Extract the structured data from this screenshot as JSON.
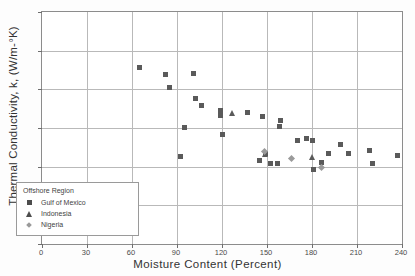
{
  "chart_data": {
    "type": "scatter",
    "title": "",
    "xlabel": "Moisture Content (Percent)",
    "ylabel": "Thermal Conductivity, k, (W/m-°K)",
    "xlim": [
      0,
      240
    ],
    "ylim": [
      0.6,
      1.2
    ],
    "xticks": [
      0,
      30,
      60,
      90,
      120,
      150,
      180,
      210,
      240
    ],
    "yticks": [
      0.6,
      0.7,
      0.8,
      0.9,
      1.0,
      1.1,
      1.2
    ],
    "xtick_labels": [
      "0",
      "30",
      "60",
      "90",
      "120",
      "150",
      "180",
      "210",
      "240"
    ],
    "ytick_labels": [
      "0.6",
      "0.7",
      "0.8",
      "0.9",
      "1.0",
      "1.1",
      "1.2"
    ],
    "grid": true,
    "legend_position": "lower-left",
    "legend_title": "Offshore Region",
    "series": [
      {
        "name": "Gulf of Mexico",
        "marker": "square",
        "color": "#5a5a5a",
        "points": [
          [
            65,
            1.056
          ],
          [
            82,
            1.038
          ],
          [
            85,
            1.004
          ],
          [
            92,
            0.826
          ],
          [
            95,
            0.902
          ],
          [
            101,
            1.042
          ],
          [
            102,
            0.977
          ],
          [
            106,
            0.957
          ],
          [
            119,
            0.945
          ],
          [
            119,
            0.932
          ],
          [
            120,
            0.884
          ],
          [
            137,
            0.939
          ],
          [
            147,
            0.93
          ],
          [
            145,
            0.815
          ],
          [
            149,
            0.834
          ],
          [
            152,
            0.808
          ],
          [
            157,
            0.807
          ],
          [
            158,
            0.904
          ],
          [
            159,
            0.919
          ],
          [
            170,
            0.868
          ],
          [
            176,
            0.872
          ],
          [
            180,
            0.867
          ],
          [
            181,
            0.792
          ],
          [
            186,
            0.812
          ],
          [
            191,
            0.835
          ],
          [
            199,
            0.858
          ],
          [
            204,
            0.834
          ],
          [
            218,
            0.843
          ],
          [
            220,
            0.807
          ],
          [
            237,
            0.83
          ]
        ]
      },
      {
        "name": "Indonesia",
        "marker": "triangle",
        "color": "#5a5a5a",
        "points": [
          [
            127,
            0.938
          ],
          [
            149,
            0.832
          ],
          [
            180,
            0.824
          ]
        ]
      },
      {
        "name": "Nigeria",
        "marker": "diamond",
        "color": "#9a9a9a",
        "points": [
          [
            148,
            0.84
          ],
          [
            166,
            0.821
          ],
          [
            186,
            0.798
          ]
        ]
      }
    ]
  }
}
